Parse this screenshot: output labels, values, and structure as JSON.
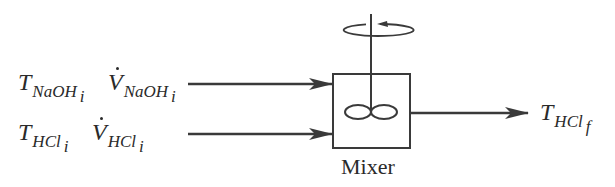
{
  "diagram": {
    "type": "process-flow",
    "colors": {
      "stroke": "#3a3a3a",
      "text": "#2a2a2a",
      "background": "#ffffff"
    },
    "inputs": [
      {
        "temperature": {
          "symbol": "T",
          "subscript": "NaOH",
          "sub_index": "i"
        },
        "flow": {
          "symbol": "V",
          "subscript": "NaOH",
          "sub_index": "i"
        }
      },
      {
        "temperature": {
          "symbol": "T",
          "subscript": "HCl",
          "sub_index": "i"
        },
        "flow": {
          "symbol": "V",
          "subscript": "HCl",
          "sub_index": "i"
        }
      }
    ],
    "unit": {
      "label": "Mixer",
      "icon": "stirrer-impeller-icon",
      "rotation": "rotation-arrow-icon"
    },
    "output": {
      "symbol": "T",
      "subscript": "HCl",
      "sub_index": "f"
    }
  }
}
